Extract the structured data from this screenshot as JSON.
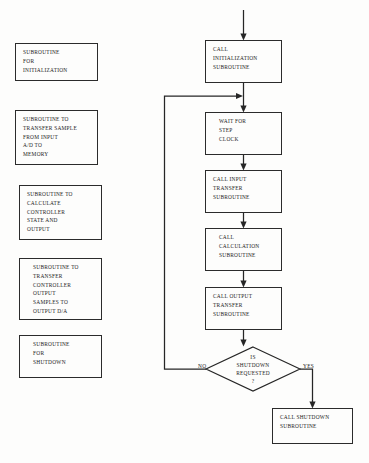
{
  "diagram": {
    "stroke_color": "#262626",
    "background_color": "#fdfdfc",
    "subroutine_boxes": [
      {
        "id": "init",
        "label": "SUBROUTINE\nFOR\nINITIALIZATION"
      },
      {
        "id": "input-transfer",
        "label": "SUBROUTINE TO\nTRANSFER SAMPLE\nFROM INPUT\nA/D TO\nMEMORY"
      },
      {
        "id": "calculate",
        "label": "SUBROUTINE TO\nCALCULATE\nCONTROLLER\nSTATE AND\nOUTPUT"
      },
      {
        "id": "output-transfer",
        "label": "SUBROUTINE TO\nTRANSFER\nCONTROLLER\nOUTPUT\nSAMPLES TO\nOUTPUT D/A"
      },
      {
        "id": "shutdown",
        "label": "SUBROUTINE\nFOR\nSHUTDOWN"
      }
    ],
    "flow_boxes": [
      {
        "id": "call-init",
        "label": "CALL\nINITIALIZATION\nSUBROUTINE"
      },
      {
        "id": "wait-step-clock",
        "label": "WAIT FOR\nSTEP\nCLOCK"
      },
      {
        "id": "call-input-transfer",
        "label": "CALL INPUT\nTRANSFER\nSUBROUTINE"
      },
      {
        "id": "call-calculation",
        "label": "CALL\nCALCULATION\nSUBROUTINE"
      },
      {
        "id": "call-output-transfer",
        "label": "CALL OUTPUT\nTRANSFER\nSUBROUTINE"
      },
      {
        "id": "call-shutdown",
        "label": "CALL SHUTDOWN\nSUBROUTINE"
      }
    ],
    "decision": {
      "id": "is-shutdown-requested",
      "line1": "IS",
      "line2": "SHUTDOWN",
      "line3": "REQUESTED",
      "line4": "?"
    },
    "branches": {
      "no_label": "NO",
      "yes_label": "YES"
    }
  }
}
